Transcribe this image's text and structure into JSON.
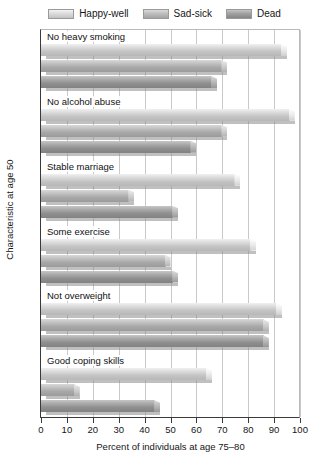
{
  "chart_data": {
    "type": "bar",
    "orientation": "horizontal",
    "title": "",
    "xlabel": "Percent of individuals at age 75–80",
    "ylabel": "Characteristic at age 50",
    "xlim": [
      0,
      100
    ],
    "xticks": [
      0,
      10,
      20,
      30,
      40,
      50,
      60,
      70,
      80,
      90,
      100
    ],
    "grid": true,
    "legend_position": "top",
    "categories": [
      "No heavy smoking",
      "No alcohol abuse",
      "Stable marriage",
      "Some exercise",
      "Not overweight",
      "Good coping skills"
    ],
    "series": [
      {
        "name": "Happy-well",
        "color": "#dcdcdc",
        "values": [
          95,
          98,
          77,
          83,
          93,
          66
        ]
      },
      {
        "name": "Sad-sick",
        "color": "#b8b8b8",
        "values": [
          72,
          72,
          36,
          50,
          88,
          15
        ]
      },
      {
        "name": "Dead",
        "color": "#969696",
        "values": [
          68,
          60,
          53,
          53,
          88,
          46
        ]
      }
    ]
  },
  "legend": {
    "items": [
      {
        "label": "Happy-well"
      },
      {
        "label": "Sad-sick"
      },
      {
        "label": "Dead"
      }
    ]
  },
  "axes": {
    "x_title": "Percent of individuals at age 75–80",
    "y_title": "Characteristic at age 50",
    "x_tick_labels": [
      "0",
      "10",
      "20",
      "30",
      "40",
      "50",
      "60",
      "70",
      "80",
      "90",
      "100"
    ]
  }
}
